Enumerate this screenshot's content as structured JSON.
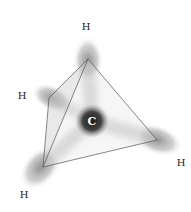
{
  "diagram": {
    "molecule": "methane",
    "colors": {
      "background": "#ffffff",
      "orbital": "#8a8a8a",
      "carbon_core": "#1a1a1a",
      "tetra_face": "#d8d8d8",
      "tetra_edge": "#555555",
      "label": "#222222",
      "carbon_label": "#ffffff"
    },
    "carbon": {
      "label": "C",
      "x": 92,
      "y": 121
    },
    "hydrogens": [
      {
        "id": "top",
        "label": "H",
        "x": 86,
        "y": 27,
        "vertex_x": 88,
        "vertex_y": 59,
        "lobe_cx": 88,
        "lobe_cy": 62,
        "lobe_rx": 15,
        "lobe_ry": 23,
        "lobe_rot": 0
      },
      {
        "id": "left",
        "label": "H",
        "x": 22,
        "y": 96,
        "vertex_x": 49,
        "vertex_y": 98,
        "lobe_cx": 52,
        "lobe_cy": 98,
        "lobe_rx": 22,
        "lobe_ry": 13,
        "lobe_rot": 25
      },
      {
        "id": "bottom-left",
        "label": "H",
        "x": 24,
        "y": 195,
        "vertex_x": 43,
        "vertex_y": 167,
        "lobe_cx": 42,
        "lobe_cy": 166,
        "lobe_rx": 17,
        "lobe_ry": 24,
        "lobe_rot": 40
      },
      {
        "id": "right",
        "label": "H",
        "x": 181,
        "y": 163,
        "vertex_x": 157,
        "vertex_y": 140,
        "lobe_cx": 155,
        "lobe_cy": 139,
        "lobe_rx": 25,
        "lobe_ry": 14,
        "lobe_rot": 20
      }
    ]
  }
}
